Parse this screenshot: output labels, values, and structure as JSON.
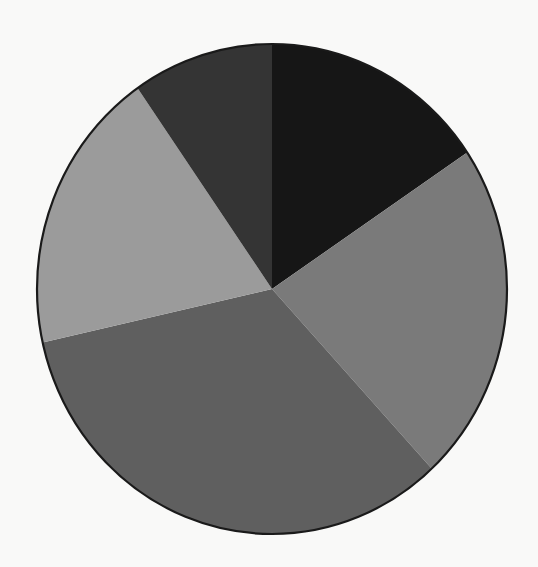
{
  "chart_data": {
    "type": "pie",
    "title": "",
    "legend": [],
    "labels_visible": false,
    "start_angle_deg": 0,
    "direction": "clockwise",
    "slices": [
      {
        "name": "Slice 1",
        "value": 15.6,
        "color": "#161616"
      },
      {
        "name": "Slice 2",
        "value": 22.5,
        "color": "#7a7a7a"
      },
      {
        "name": "Slice 3",
        "value": 33.4,
        "color": "#5f5f5f"
      },
      {
        "name": "Slice 4",
        "value": 18.8,
        "color": "#9b9b9b"
      },
      {
        "name": "Slice 5",
        "value": 9.7,
        "color": "#343434"
      }
    ],
    "categories": [
      "Slice 1",
      "Slice 2",
      "Slice 3",
      "Slice 4",
      "Slice 5"
    ],
    "values": [
      15.6,
      22.5,
      33.4,
      18.8,
      9.7
    ],
    "geometry": {
      "cx": 272,
      "cy": 289,
      "rx": 235,
      "ry": 245
    }
  },
  "colors": {
    "background": "#f9f9f8",
    "outline": "#1a1a1a"
  }
}
